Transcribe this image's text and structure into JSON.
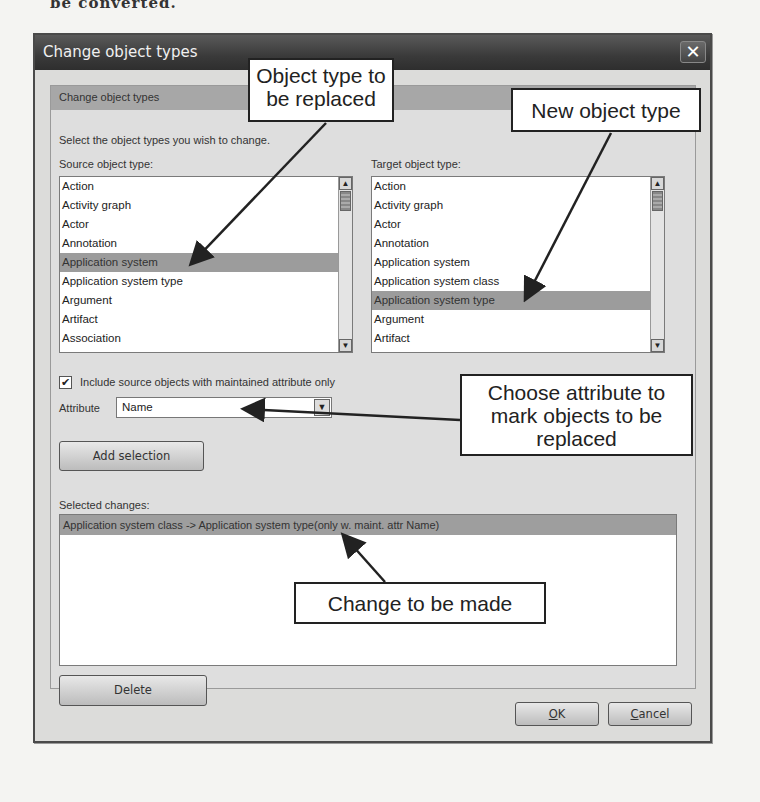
{
  "background_text": "be converted.",
  "dialog": {
    "title": "Change object types",
    "close_icon": "✕",
    "group_title": "Change object types",
    "instruction": "Select the object types you wish to change.",
    "source": {
      "label": "Source object type:",
      "items": [
        "Action",
        "Activity graph",
        "Actor",
        "Annotation",
        "Application system",
        "Application system type",
        "Argument",
        "Artifact",
        "Association"
      ],
      "selected_index": 4
    },
    "target": {
      "label": "Target object type:",
      "items": [
        "Action",
        "Activity graph",
        "Actor",
        "Annotation",
        "Application system",
        "Application system class",
        "Application system type",
        "Argument",
        "Artifact"
      ],
      "selected_index": 6
    },
    "include_checkbox": {
      "checked": true,
      "check_glyph": "✔",
      "label": "Include source objects with maintained attribute only"
    },
    "attribute": {
      "label": "Attribute",
      "value": "Name",
      "dropdown_glyph": "▼"
    },
    "add_selection_label": "Add selection",
    "selected_changes": {
      "label": "Selected changes:",
      "rows": [
        "Application system class -> Application system type(only w. maint. attr Name)"
      ]
    },
    "delete_label": "Delete",
    "ok_label": "OK",
    "ok_mnemonic": "O",
    "cancel_label": "Cancel",
    "cancel_mnemonic": "C"
  },
  "scroll_glyphs": {
    "up": "▲",
    "down": "▼"
  },
  "callouts": {
    "replaced": "Object type to be replaced",
    "new_type": "New object type",
    "attribute": "Choose attribute to mark objects to be replaced",
    "change": "Change to be made"
  }
}
